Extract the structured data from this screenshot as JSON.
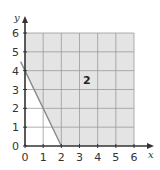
{
  "chart_data": {
    "type": "area",
    "title": "",
    "xlabel": "x",
    "ylabel": "y",
    "xlim": [
      0,
      6
    ],
    "ylim": [
      0,
      6
    ],
    "grid": true,
    "xticks": [
      "0",
      "1",
      "2",
      "3",
      "4",
      "5",
      "6"
    ],
    "yticks": [
      "0",
      "1",
      "2",
      "3",
      "4",
      "5",
      "6"
    ],
    "boundary_line": {
      "points": [
        [
          0,
          4
        ],
        [
          2,
          0
        ]
      ],
      "style": "solid"
    },
    "shaded_region": {
      "description": "region above/right of the line through (0,4) and (2,0), bounded by x=6 and y=6",
      "polygon": [
        [
          0,
          4
        ],
        [
          2,
          0
        ],
        [
          6,
          0
        ],
        [
          6,
          6
        ],
        [
          0,
          6
        ]
      ],
      "label": "2",
      "label_position": [
        3.4,
        3.5
      ]
    },
    "colors": {
      "shade": "#e4e4e4",
      "grid": "#9a9a9a",
      "axis": "#333333",
      "line": "#8a8a8a"
    }
  }
}
